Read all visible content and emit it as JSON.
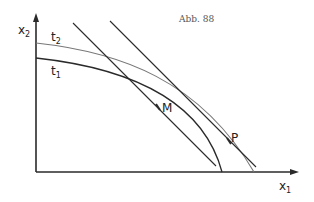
{
  "figure": {
    "caption": "Abb. 88",
    "axes": {
      "x_label": "x",
      "x_sub": "1",
      "y_label": "x",
      "y_sub": "2"
    },
    "curves": [
      {
        "label": "t",
        "sub": "1"
      },
      {
        "label": "t",
        "sub": "2"
      }
    ],
    "points": [
      {
        "label": "M"
      },
      {
        "label": "P"
      }
    ],
    "colors": {
      "ink": "#2a2a2a",
      "light_ink": "#777777"
    }
  }
}
